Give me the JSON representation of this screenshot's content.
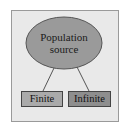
{
  "diagram": {
    "root": {
      "label_line1": "Population",
      "label_line2": "source",
      "fill": "#9a9a9a"
    },
    "children": [
      {
        "label": "Finite",
        "fill": "#aaaaaa"
      },
      {
        "label": "Infinite",
        "fill": "#8e8e8e"
      }
    ],
    "background": "#e9e9e9"
  }
}
